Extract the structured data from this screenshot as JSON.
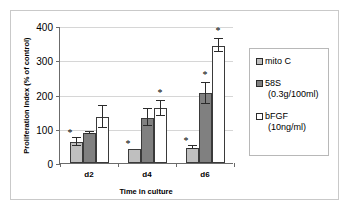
{
  "chart_data": {
    "type": "bar",
    "title": "",
    "xlabel": "Time in culture",
    "ylabel": "Proliferation Index (% of control)",
    "categories": [
      "d2",
      "d4",
      "d6"
    ],
    "ylim": [
      0,
      400
    ],
    "yticks": [
      0,
      100,
      200,
      300,
      400
    ],
    "ytick_labels": [
      "0",
      "100",
      "200",
      "300",
      "400"
    ],
    "grid": true,
    "legend_position": "right",
    "series": [
      {
        "name": "mito C",
        "sublabel": "",
        "color": "#bfbfbf",
        "values": [
          62,
          40,
          45
        ],
        "errors": [
          12,
          0,
          5
        ],
        "significance": [
          "*",
          "*",
          "*"
        ]
      },
      {
        "name": "58S",
        "sublabel": "(0.3g/100ml)",
        "color": "#808080",
        "values": [
          88,
          132,
          203
        ],
        "errors": [
          4,
          25,
          32
        ],
        "significance": [
          "",
          "",
          "*"
        ]
      },
      {
        "name": "bFGF",
        "sublabel": "(10ng/ml)",
        "color": "#ffffff",
        "values": [
          135,
          160,
          343
        ],
        "errors": [
          32,
          22,
          20
        ],
        "significance": [
          "",
          "*",
          "*"
        ]
      }
    ]
  },
  "legend": {
    "entries": [
      {
        "label": "mito C",
        "sublabel": ""
      },
      {
        "label": "58S",
        "sublabel": "(0.3g/100ml)"
      },
      {
        "label": "bFGF",
        "sublabel": "(10ng/ml)"
      }
    ]
  },
  "axes": {
    "y_title": "Proliferation Index (% of control)",
    "x_title": "Time in culture"
  }
}
